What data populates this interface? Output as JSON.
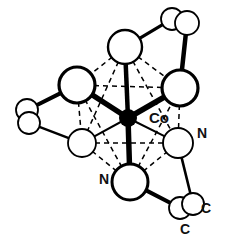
{
  "figure": {
    "background_color": "#ffffff",
    "ink_color": "#000000",
    "canvas": {
      "width": 225,
      "height": 244
    }
  },
  "labels": {
    "metal": "Co",
    "nitrogen_right": "N",
    "nitrogen_bottom": "N",
    "carbon_right": "C",
    "carbon_bottom": "C"
  },
  "atoms": {
    "metal": {
      "symbol": "Co",
      "element": "cobalt",
      "fill": "#000000",
      "x": 128,
      "y": 118,
      "radius": 9,
      "label_x": 149,
      "label_y": 123,
      "label_size": 15
    },
    "donors": [
      {
        "id": "n-top",
        "symbol": "N",
        "element": "nitrogen",
        "x": 125,
        "y": 47,
        "radius": 17,
        "stroke": 2.4,
        "labelled": false
      },
      {
        "id": "n-upper-left",
        "symbol": "N",
        "element": "nitrogen",
        "x": 77,
        "y": 85,
        "radius": 18,
        "stroke": 3.2,
        "labelled": false
      },
      {
        "id": "n-upper-right",
        "symbol": "N",
        "element": "nitrogen",
        "x": 180,
        "y": 88,
        "radius": 18,
        "stroke": 3.2,
        "labelled": false
      },
      {
        "id": "n-lower-left",
        "symbol": "N",
        "element": "nitrogen",
        "x": 82,
        "y": 143,
        "radius": 14,
        "stroke": 1.8,
        "labelled": false
      },
      {
        "id": "n-lower-right",
        "symbol": "N",
        "element": "nitrogen",
        "x": 178,
        "y": 143,
        "radius": 15,
        "stroke": 1.9,
        "labelled": true,
        "label_x": 202,
        "label_y": 138,
        "label_size": 14
      },
      {
        "id": "n-bottom",
        "symbol": "N",
        "element": "nitrogen",
        "x": 130,
        "y": 182,
        "radius": 18,
        "stroke": 3.0,
        "labelled": true,
        "label_x": 104,
        "label_y": 184,
        "label_size": 14
      }
    ],
    "carbons": [
      {
        "id": "c-top-right-a",
        "symbol": "C",
        "element": "carbon",
        "x": 172,
        "y": 19,
        "radius": 11,
        "stroke": 1.8,
        "labelled": false
      },
      {
        "id": "c-top-right-b",
        "symbol": "C",
        "element": "carbon",
        "x": 187,
        "y": 23,
        "radius": 12,
        "stroke": 1.8,
        "labelled": false
      },
      {
        "id": "c-left-a",
        "symbol": "C",
        "element": "carbon",
        "x": 27,
        "y": 110,
        "radius": 11,
        "stroke": 1.8,
        "labelled": false
      },
      {
        "id": "c-left-b",
        "symbol": "C",
        "element": "carbon",
        "x": 29,
        "y": 123,
        "radius": 11,
        "stroke": 1.8,
        "labelled": false
      },
      {
        "id": "c-bottom-right-a",
        "symbol": "C",
        "element": "carbon",
        "x": 180,
        "y": 208,
        "radius": 11,
        "stroke": 1.8,
        "labelled": true,
        "label_x": 185,
        "label_y": 234,
        "label_size": 14
      },
      {
        "id": "c-bottom-right-b",
        "symbol": "C",
        "element": "carbon",
        "x": 193,
        "y": 204,
        "radius": 11,
        "stroke": 1.8,
        "labelled": true,
        "label_x": 206,
        "label_y": 213,
        "label_size": 14
      }
    ]
  },
  "bonds": {
    "metal_to_donor": [
      {
        "from": "metal",
        "to": "n-top",
        "style": "solid-bold",
        "width": 4.5
      },
      {
        "from": "metal",
        "to": "n-upper-left",
        "style": "solid-bold",
        "width": 5.5
      },
      {
        "from": "metal",
        "to": "n-upper-right",
        "style": "solid-bold",
        "width": 5.5
      },
      {
        "from": "metal",
        "to": "n-lower-left",
        "style": "solid-thin",
        "width": 2.0
      },
      {
        "from": "metal",
        "to": "n-lower-right",
        "style": "solid-thin",
        "width": 2.0
      },
      {
        "from": "metal",
        "to": "n-bottom",
        "style": "solid-bold",
        "width": 5.5
      }
    ],
    "octahedron_edges": [
      {
        "from": "n-top",
        "to": "n-upper-left",
        "style": "dashed"
      },
      {
        "from": "n-top",
        "to": "n-upper-right",
        "style": "dashed"
      },
      {
        "from": "n-top",
        "to": "n-lower-left",
        "style": "dashed"
      },
      {
        "from": "n-top",
        "to": "n-lower-right",
        "style": "dashed"
      },
      {
        "from": "n-bottom",
        "to": "n-upper-left",
        "style": "dashed"
      },
      {
        "from": "n-bottom",
        "to": "n-upper-right",
        "style": "dashed"
      },
      {
        "from": "n-bottom",
        "to": "n-lower-left",
        "style": "dashed"
      },
      {
        "from": "n-bottom",
        "to": "n-lower-right",
        "style": "dashed"
      },
      {
        "from": "n-upper-left",
        "to": "n-upper-right",
        "style": "dashed"
      },
      {
        "from": "n-upper-left",
        "to": "n-lower-left",
        "style": "dashed"
      },
      {
        "from": "n-upper-right",
        "to": "n-lower-right",
        "style": "dashed"
      },
      {
        "from": "n-lower-left",
        "to": "n-lower-right",
        "style": "dashed"
      }
    ],
    "chelate_backbone": [
      {
        "from": "n-top",
        "to": "c-top-right-a",
        "style": "solid",
        "width": 3.2
      },
      {
        "from": "c-top-right-b",
        "to": "n-upper-right",
        "style": "solid-bold",
        "width": 4.5
      },
      {
        "from": "n-upper-left",
        "to": "c-left-a",
        "style": "solid-bold",
        "width": 4.0
      },
      {
        "from": "c-left-b",
        "to": "n-lower-left",
        "style": "solid",
        "width": 2.4
      },
      {
        "from": "n-bottom",
        "to": "c-bottom-right-a",
        "style": "solid-bold",
        "width": 4.0
      },
      {
        "from": "c-bottom-right-b",
        "to": "n-lower-right",
        "style": "solid",
        "width": 2.6
      }
    ]
  }
}
